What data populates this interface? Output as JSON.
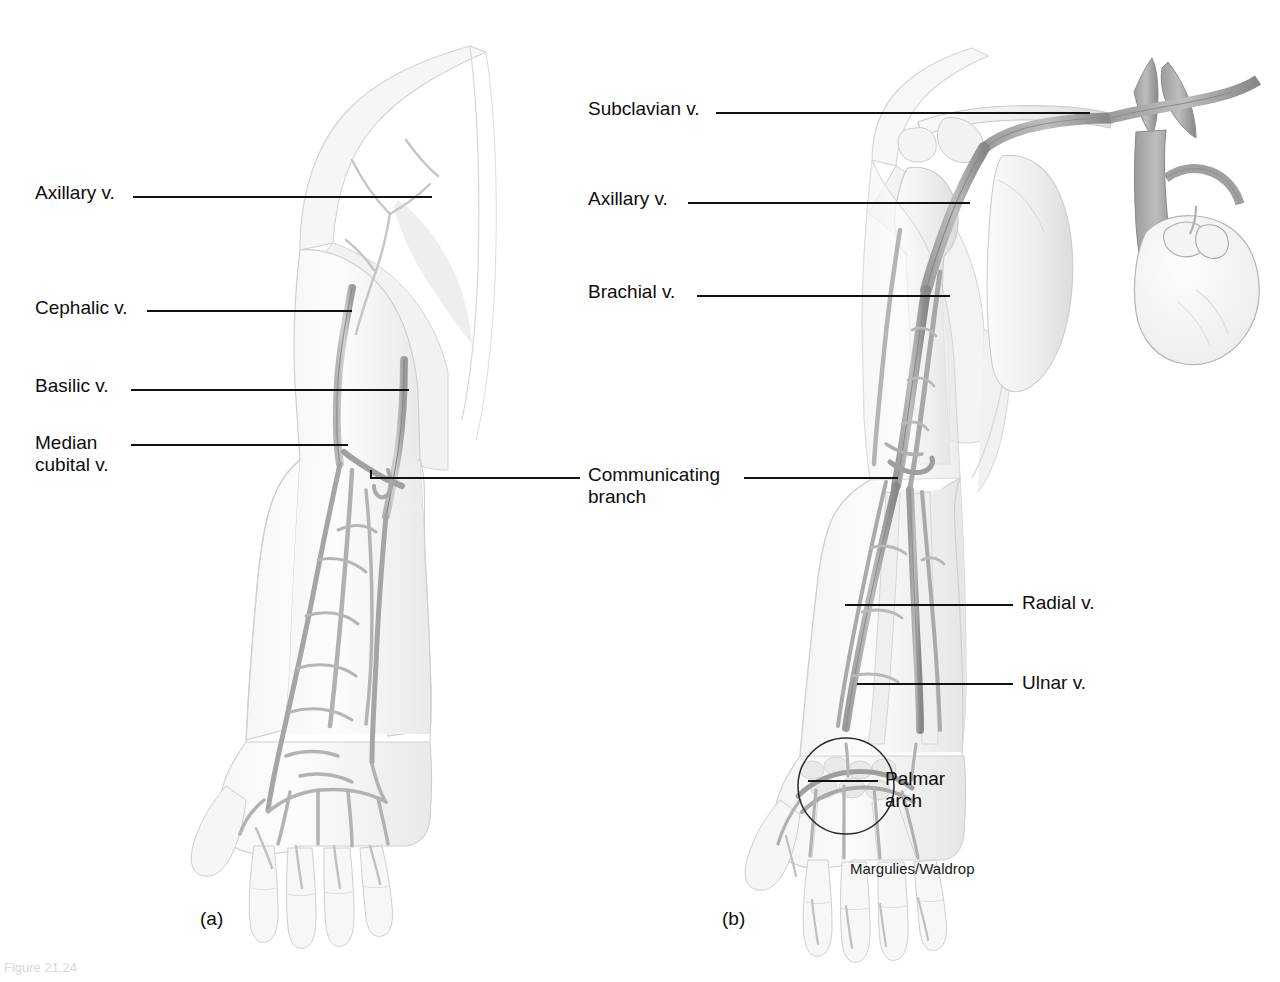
{
  "figure": {
    "credit": "Margulies/Waldrop",
    "footnote": "Figure",
    "panels": [
      {
        "id": "a",
        "caption": "(a)",
        "description": "Superficial veins of the right upper limb, anterior view"
      },
      {
        "id": "b",
        "caption": "(b)",
        "description": "Deep veins of the right upper limb with heart, anterior view"
      }
    ],
    "colors": {
      "leader_line": "#111111",
      "vein_outline": "#8a8a8a",
      "vein_fill": "#c9c9c9",
      "skin_outline": "#cfcfcf",
      "bone_fill": "#ececec",
      "background": "#ffffff"
    }
  },
  "labels_left": [
    {
      "text": "Axillary v.",
      "x": 35,
      "y": 182
    },
    {
      "text": "Cephalic v.",
      "x": 35,
      "y": 297
    },
    {
      "text": "Basilic v.",
      "x": 35,
      "y": 375
    },
    {
      "text": "Median\ncubital v.",
      "x": 35,
      "y": 432
    }
  ],
  "labels_center": [
    {
      "text": "Subclavian v.",
      "x": 588,
      "y": 95
    },
    {
      "text": "Axillary v.",
      "x": 588,
      "y": 188
    },
    {
      "text": "Brachial v.",
      "x": 588,
      "y": 281
    },
    {
      "text": "Communicating\nbranch",
      "x": 588,
      "y": 464
    }
  ],
  "labels_right": [
    {
      "text": "Radial v.",
      "x": 1022,
      "y": 592
    },
    {
      "text": "Ulnar v.",
      "x": 1022,
      "y": 672
    },
    {
      "text": "Palmar\narch",
      "x": 885,
      "y": 770
    }
  ],
  "captions": [
    {
      "text": "(a)",
      "x": 200,
      "y": 910
    },
    {
      "text": "(b)",
      "x": 722,
      "y": 910
    }
  ],
  "credit": {
    "text": "Margulies/Waldrop",
    "x": 850,
    "y": 866
  },
  "footnote": {
    "text": "Figure 21.24",
    "x": 4,
    "y": 962
  }
}
